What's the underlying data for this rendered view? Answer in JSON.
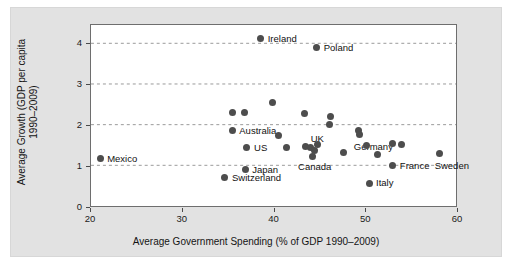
{
  "chart_data": {
    "type": "scatter",
    "title": "",
    "xlabel": "Average Government Spending (% of GDP 1990–2009)",
    "ylabel_line1": "Average Growth (GDP per capita",
    "ylabel_line2": "1990–2009)",
    "xlim": [
      20,
      60
    ],
    "ylim": [
      0,
      4.45
    ],
    "xticks": [
      "20",
      "30",
      "40",
      "50",
      "60"
    ],
    "xtick_values": [
      20,
      30,
      40,
      50,
      60
    ],
    "yticks": [
      "0",
      "1",
      "2",
      "3",
      "4"
    ],
    "ytick_values": [
      0,
      1,
      2,
      3,
      4
    ],
    "grid": "horizontal-dashed",
    "legend": "none",
    "marker_color": "#4d4d4d",
    "points": [
      {
        "label": "Mexico",
        "x": 21.0,
        "y": 1.2,
        "label_dx": 7,
        "label_dy": 0
      },
      {
        "label": "Switzerland",
        "x": 34.6,
        "y": 0.73,
        "label_dx": 7,
        "label_dy": 0
      },
      {
        "label": "",
        "x": 35.4,
        "y": 2.32,
        "label_dx": 0,
        "label_dy": 0
      },
      {
        "label": "Australia",
        "x": 35.4,
        "y": 1.88,
        "label_dx": 7,
        "label_dy": 0
      },
      {
        "label": "",
        "x": 36.7,
        "y": 2.32,
        "label_dx": 0,
        "label_dy": 0
      },
      {
        "label": "Japan",
        "x": 36.8,
        "y": 0.93,
        "label_dx": 7,
        "label_dy": 0
      },
      {
        "label": "US",
        "x": 36.9,
        "y": 1.47,
        "label_dx": 8,
        "label_dy": 0
      },
      {
        "label": "Ireland",
        "x": 38.5,
        "y": 4.12,
        "label_dx": 7,
        "label_dy": 0
      },
      {
        "label": "",
        "x": 39.8,
        "y": 2.57,
        "label_dx": 0,
        "label_dy": 0
      },
      {
        "label": "",
        "x": 40.4,
        "y": 1.76,
        "label_dx": 0,
        "label_dy": 0
      },
      {
        "label": "",
        "x": 41.3,
        "y": 1.48,
        "label_dx": 0,
        "label_dy": 0
      },
      {
        "label": "",
        "x": 43.3,
        "y": 2.31,
        "label_dx": 0,
        "label_dy": 0
      },
      {
        "label": "UK",
        "x": 43.4,
        "y": 1.5,
        "label_dx": 5,
        "label_dy": -7
      },
      {
        "label": "",
        "x": 43.9,
        "y": 1.48,
        "label_dx": 0,
        "label_dy": 0
      },
      {
        "label": "Canada",
        "x": 44.1,
        "y": 1.25,
        "label_dx": -14,
        "label_dy": 10
      },
      {
        "label": "",
        "x": 44.4,
        "y": 1.4,
        "label_dx": 0,
        "label_dy": 0
      },
      {
        "label": "Poland",
        "x": 44.6,
        "y": 3.9,
        "label_dx": 7,
        "label_dy": 0
      },
      {
        "label": "",
        "x": 44.7,
        "y": 1.54,
        "label_dx": 0,
        "label_dy": 0
      },
      {
        "label": "",
        "x": 46.1,
        "y": 2.22,
        "label_dx": 0,
        "label_dy": 0
      },
      {
        "label": "",
        "x": 46.0,
        "y": 2.04,
        "label_dx": 0,
        "label_dy": 0
      },
      {
        "label": "",
        "x": 47.5,
        "y": 1.34,
        "label_dx": 0,
        "label_dy": 0
      },
      {
        "label": "",
        "x": 49.2,
        "y": 1.89,
        "label_dx": 0,
        "label_dy": 0
      },
      {
        "label": "Germany",
        "x": 49.3,
        "y": 1.79,
        "label_dx": -6,
        "label_dy": 13
      },
      {
        "label": "",
        "x": 50.0,
        "y": 1.53,
        "label_dx": 0,
        "label_dy": 0
      },
      {
        "label": "Italy",
        "x": 50.3,
        "y": 0.6,
        "label_dx": 7,
        "label_dy": 0
      },
      {
        "label": "",
        "x": 51.2,
        "y": 1.29,
        "label_dx": 0,
        "label_dy": 0
      },
      {
        "label": "France",
        "x": 52.9,
        "y": 1.04,
        "label_dx": 7,
        "label_dy": 1
      },
      {
        "label": "",
        "x": 52.9,
        "y": 1.58,
        "label_dx": 0,
        "label_dy": 0
      },
      {
        "label": "",
        "x": 53.8,
        "y": 1.54,
        "label_dx": 0,
        "label_dy": 0
      },
      {
        "label": "Sweden",
        "x": 58.0,
        "y": 1.32,
        "label_dx": -5,
        "label_dy": 12
      }
    ]
  }
}
